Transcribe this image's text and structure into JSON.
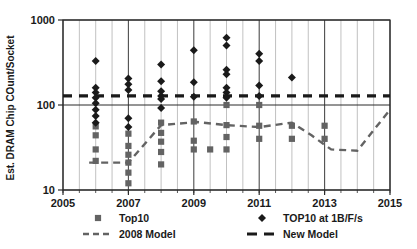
{
  "chart_data": {
    "type": "scatter",
    "title": "",
    "xlabel": "",
    "ylabel": "Est. DRAM Chip COunt/Socket",
    "yscale": "log",
    "ylim": [
      10,
      1000
    ],
    "xlim": [
      2005,
      2015
    ],
    "grid": true,
    "legend_position": "bottom",
    "y_tick_labels": [
      "1000",
      "100",
      "10"
    ],
    "y_tick_values": [
      1000,
      100,
      10
    ],
    "x_tick_labels": [
      "2005",
      "2007",
      "2009",
      "2011",
      "2013",
      "2015"
    ],
    "x_tick_values": [
      2005,
      2007,
      2009,
      2011,
      2013,
      2015
    ],
    "x_minor_step": 0.5,
    "series": [
      {
        "name": "Top10",
        "marker": "square",
        "color": "#636363",
        "points": [
          {
            "x": 2006.0,
            "y": 56
          },
          {
            "x": 2006.0,
            "y": 44
          },
          {
            "x": 2006.0,
            "y": 30
          },
          {
            "x": 2006.0,
            "y": 22
          },
          {
            "x": 2007.0,
            "y": 46
          },
          {
            "x": 2007.0,
            "y": 33
          },
          {
            "x": 2007.0,
            "y": 26
          },
          {
            "x": 2007.0,
            "y": 21
          },
          {
            "x": 2007.0,
            "y": 16
          },
          {
            "x": 2007.0,
            "y": 12
          },
          {
            "x": 2008.0,
            "y": 62
          },
          {
            "x": 2008.0,
            "y": 47
          },
          {
            "x": 2008.0,
            "y": 37
          },
          {
            "x": 2008.0,
            "y": 28
          },
          {
            "x": 2008.0,
            "y": 20
          },
          {
            "x": 2009.0,
            "y": 64
          },
          {
            "x": 2009.0,
            "y": 38
          },
          {
            "x": 2009.0,
            "y": 30
          },
          {
            "x": 2009.5,
            "y": 30
          },
          {
            "x": 2010.0,
            "y": 100
          },
          {
            "x": 2010.0,
            "y": 58
          },
          {
            "x": 2010.0,
            "y": 42
          },
          {
            "x": 2010.0,
            "y": 30
          },
          {
            "x": 2011.0,
            "y": 100
          },
          {
            "x": 2011.0,
            "y": 57
          },
          {
            "x": 2011.0,
            "y": 40
          },
          {
            "x": 2012.0,
            "y": 57
          },
          {
            "x": 2012.0,
            "y": 40
          },
          {
            "x": 2013.0,
            "y": 57
          },
          {
            "x": 2013.0,
            "y": 40
          }
        ]
      },
      {
        "name": "TOP10 at 1B/F/s",
        "marker": "diamond",
        "color": "#1a1a1a",
        "points": [
          {
            "x": 2006.0,
            "y": 330
          },
          {
            "x": 2006.0,
            "y": 160
          },
          {
            "x": 2006.0,
            "y": 140
          },
          {
            "x": 2006.0,
            "y": 122
          },
          {
            "x": 2006.0,
            "y": 105
          },
          {
            "x": 2006.0,
            "y": 88
          },
          {
            "x": 2006.0,
            "y": 74
          },
          {
            "x": 2006.0,
            "y": 62
          },
          {
            "x": 2007.0,
            "y": 205
          },
          {
            "x": 2007.0,
            "y": 175
          },
          {
            "x": 2007.0,
            "y": 150
          },
          {
            "x": 2007.0,
            "y": 70
          },
          {
            "x": 2007.0,
            "y": 55
          },
          {
            "x": 2008.0,
            "y": 300
          },
          {
            "x": 2008.0,
            "y": 190
          },
          {
            "x": 2008.0,
            "y": 145
          },
          {
            "x": 2008.0,
            "y": 128
          },
          {
            "x": 2008.0,
            "y": 118
          },
          {
            "x": 2008.0,
            "y": 92
          },
          {
            "x": 2009.0,
            "y": 440
          },
          {
            "x": 2009.0,
            "y": 185
          },
          {
            "x": 2009.0,
            "y": 125
          },
          {
            "x": 2010.0,
            "y": 260
          },
          {
            "x": 2010.0,
            "y": 230
          },
          {
            "x": 2010.0,
            "y": 620
          },
          {
            "x": 2010.0,
            "y": 500
          },
          {
            "x": 2010.0,
            "y": 160
          },
          {
            "x": 2010.0,
            "y": 140
          },
          {
            "x": 2010.0,
            "y": 122
          },
          {
            "x": 2011.0,
            "y": 400
          },
          {
            "x": 2011.0,
            "y": 330
          },
          {
            "x": 2011.0,
            "y": 170
          },
          {
            "x": 2011.0,
            "y": 128
          },
          {
            "x": 2012.0,
            "y": 210
          }
        ]
      },
      {
        "name": "2008 Model",
        "marker": "dashed-line",
        "color": "#636363",
        "points": [
          {
            "x": 2005.8,
            "y": 21
          },
          {
            "x": 2007.0,
            "y": 21
          },
          {
            "x": 2008.0,
            "y": 58
          },
          {
            "x": 2009.1,
            "y": 63
          },
          {
            "x": 2010.0,
            "y": 58
          },
          {
            "x": 2011.0,
            "y": 55
          },
          {
            "x": 2012.0,
            "y": 62
          },
          {
            "x": 2012.6,
            "y": 44
          },
          {
            "x": 2013.2,
            "y": 30
          },
          {
            "x": 2014.0,
            "y": 29
          },
          {
            "x": 2015.0,
            "y": 88
          }
        ]
      },
      {
        "name": "New Model",
        "marker": "thick-dashed-line",
        "color": "#1a1a1a",
        "points": [
          {
            "x": 2005.0,
            "y": 128
          },
          {
            "x": 2015.0,
            "y": 128
          }
        ]
      }
    ]
  },
  "legend": {
    "items": [
      {
        "label": "Top10",
        "marker": "square",
        "color": "#636363"
      },
      {
        "label": "TOP10 at 1B/F/s",
        "marker": "diamond",
        "color": "#1a1a1a"
      },
      {
        "label": "2008 Model",
        "marker": "dashed-line",
        "color": "#636363"
      },
      {
        "label": "New Model",
        "marker": "thick-dashed-line",
        "color": "#1a1a1a"
      }
    ]
  },
  "axes": {
    "y_title": "Est. DRAM Chip COunt/Socket",
    "y_ticks": [
      "1000",
      "100",
      "10"
    ],
    "x_ticks": [
      "2005",
      "2007",
      "2009",
      "2011",
      "2013",
      "2015"
    ]
  }
}
